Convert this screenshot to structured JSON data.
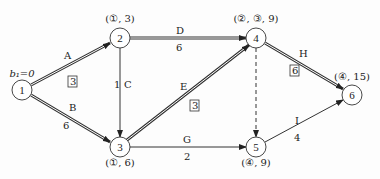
{
  "diagram": {
    "type": "activity-on-arrow network (critical path labeling)",
    "start_label": "b₁=0",
    "nodes": [
      {
        "id": "1",
        "x": 22,
        "y": 90,
        "label": ""
      },
      {
        "id": "2",
        "x": 120,
        "y": 38,
        "label": "(①, 3)"
      },
      {
        "id": "3",
        "x": 120,
        "y": 147,
        "label": "(①, 6)"
      },
      {
        "id": "4",
        "x": 256,
        "y": 38,
        "label": "(②, ③, 9)"
      },
      {
        "id": "5",
        "x": 256,
        "y": 147,
        "label": "(④, 9)"
      },
      {
        "id": "6",
        "x": 352,
        "y": 95,
        "label": "(④, 15)"
      }
    ],
    "edges": [
      {
        "name": "A",
        "from": "1",
        "to": "2",
        "weight": "3",
        "boxed": true,
        "critical": true
      },
      {
        "name": "B",
        "from": "1",
        "to": "3",
        "weight": "6",
        "boxed": false,
        "critical": true
      },
      {
        "name": "C",
        "from": "2",
        "to": "3",
        "weight": "1",
        "boxed": false,
        "critical": false
      },
      {
        "name": "D",
        "from": "2",
        "to": "4",
        "weight": "6",
        "boxed": false,
        "critical": true
      },
      {
        "name": "E",
        "from": "3",
        "to": "4",
        "weight": "3",
        "boxed": true,
        "critical": true
      },
      {
        "name": "G",
        "from": "3",
        "to": "5",
        "weight": "2",
        "boxed": false,
        "critical": false
      },
      {
        "name": "",
        "from": "4",
        "to": "5",
        "weight": "",
        "boxed": false,
        "critical": false,
        "dummy": true
      },
      {
        "name": "H",
        "from": "4",
        "to": "6",
        "weight": "6",
        "boxed": true,
        "critical": true
      },
      {
        "name": "I",
        "from": "5",
        "to": "6",
        "weight": "4",
        "boxed": false,
        "critical": false
      }
    ]
  }
}
